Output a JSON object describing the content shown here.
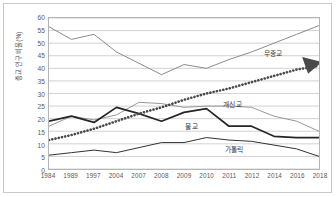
{
  "chart_data": {
    "type": "line",
    "title": "",
    "subtitle": "",
    "xlabel": "",
    "ylabel": "종교 인구 비율(%)",
    "grid": true,
    "legend_position": "inline-annotations",
    "ylim": [
      0,
      60
    ],
    "ytick_step": 5,
    "yticks": [
      "60",
      "55",
      "50",
      "45",
      "40",
      "35",
      "30",
      "25",
      "20",
      "15",
      "10",
      "5",
      "0"
    ],
    "categories": [
      "1984",
      "1989",
      "1997",
      "2004",
      "2007",
      "2008",
      "2009",
      "2010",
      "2011",
      "2012",
      "2014",
      "2016",
      "2018"
    ],
    "series": [
      {
        "name": "무종교",
        "style": "solid-gray",
        "color": "#8c8c8c",
        "values": [
          56.5,
          51.5,
          53.5,
          46.5,
          42.0,
          37.5,
          41.5,
          40.0,
          43.5,
          46.5,
          50.0,
          53.5,
          57.0
        ]
      },
      {
        "name": "개신교",
        "style": "solid-gray-thin",
        "color": "#8c8c8c",
        "values": [
          17.0,
          21.0,
          19.5,
          21.5,
          26.5,
          26.0,
          24.5,
          25.0,
          25.0,
          24.5,
          21.0,
          19.0,
          15.0
        ]
      },
      {
        "name": "불교",
        "style": "solid-black-bold",
        "color": "#262626",
        "values": [
          19.0,
          21.0,
          18.5,
          24.5,
          22.0,
          19.0,
          22.5,
          24.0,
          17.0,
          17.0,
          13.0,
          12.5,
          12.5
        ]
      },
      {
        "name": "가톨릭",
        "style": "solid-black-thin",
        "color": "#333333",
        "values": [
          5.5,
          6.5,
          7.5,
          6.5,
          8.5,
          10.5,
          10.5,
          12.5,
          11.5,
          11.0,
          9.5,
          8.0,
          5.0
        ]
      },
      {
        "name": "추세선",
        "style": "dotted-trend-arrow",
        "color": "#4a4a4a",
        "values": [
          11.5,
          13.5,
          16.0,
          19.0,
          22.0,
          24.5,
          27.5,
          30.0,
          32.0,
          34.5,
          37.0,
          39.5,
          41.0
        ]
      }
    ],
    "annotations": [
      {
        "text": "무종교",
        "x_pct": 79.5,
        "y_pct": 20.0
      },
      {
        "text": "개신교",
        "x_pct": 64.5,
        "y_pct": 53.5
      },
      {
        "text": "불교",
        "x_pct": 50.5,
        "y_pct": 68.5
      },
      {
        "text": "가톨릭",
        "x_pct": 65.0,
        "y_pct": 83.5
      }
    ]
  }
}
